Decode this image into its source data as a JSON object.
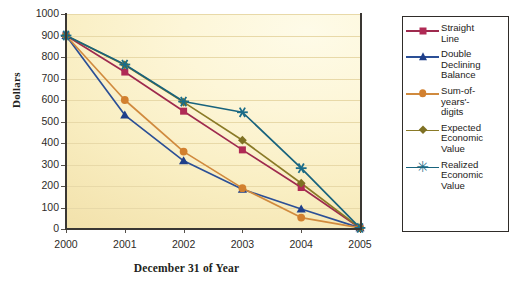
{
  "chart_data": {
    "type": "line",
    "title": "",
    "xlabel": "December 31 of Year",
    "ylabel": "Dollars",
    "categories": [
      "2000",
      "2001",
      "2002",
      "2003",
      "2004",
      "2005"
    ],
    "x": [
      2000,
      2001,
      2002,
      2003,
      2004,
      2005
    ],
    "ylim": [
      0,
      1000
    ],
    "ytick_labels": [
      "0",
      "100",
      "200",
      "300",
      "400",
      "500",
      "600",
      "700",
      "800",
      "900",
      "1000"
    ],
    "ytick_values": [
      0,
      100,
      200,
      300,
      400,
      500,
      600,
      700,
      800,
      900,
      1000
    ],
    "grid": "horizontal",
    "legend_position": "right",
    "series": [
      {
        "name": "Straight Line",
        "label_lines": "Straight\nLine",
        "color": "#9e2a4e",
        "marker": "square",
        "marker_color": "#b02a55",
        "values": [
          900,
          730,
          548,
          368,
          193,
          5
        ]
      },
      {
        "name": "Double Declining Balance",
        "label_lines": "Double\nDeclining\nBalance",
        "color": "#2b4f96",
        "marker": "triangle",
        "marker_color": "#1f3f8a",
        "values": [
          900,
          530,
          317,
          185,
          93,
          5
        ]
      },
      {
        "name": "Sum-of-years'-digits",
        "label_lines": "Sum-of-\nyears'-\ndigits",
        "color": "#d08a3e",
        "marker": "circle",
        "marker_color": "#d2802f",
        "values": [
          900,
          600,
          360,
          190,
          53,
          5
        ]
      },
      {
        "name": "Expected Economic Value",
        "label_lines": "Expected\nEconomic\nValue",
        "color": "#8a7a27",
        "marker": "diamond",
        "marker_color": "#7f7124",
        "values": [
          900,
          763,
          590,
          413,
          213,
          5
        ]
      },
      {
        "name": "Realized Economic Value",
        "label_lines": "Realized\nEconomic\nValue",
        "color": "#18637d",
        "marker": "star",
        "marker_color": "#1b6d89",
        "values": [
          900,
          765,
          593,
          543,
          283,
          5
        ]
      }
    ]
  },
  "plot": {
    "background_top": "#fefbe8",
    "background_bottom": "#eedfa6",
    "gridline_color": "#e8d9a8",
    "axis_color": "#3a3733"
  }
}
